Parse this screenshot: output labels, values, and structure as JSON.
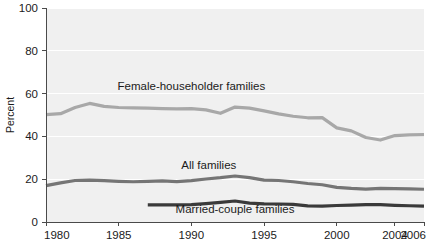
{
  "chart_data": {
    "type": "line",
    "title": "",
    "xlabel": "",
    "ylabel": "Percent",
    "ylim": [
      0,
      100
    ],
    "xlim": [
      1980,
      2006
    ],
    "grid": true,
    "legend_position": "inline-labels",
    "yticks": [
      0,
      20,
      40,
      60,
      80,
      100
    ],
    "ytick_labels": [
      "0",
      "20",
      "40",
      "60",
      "80",
      "100"
    ],
    "xticks": [
      1980,
      1985,
      1990,
      1995,
      2000,
      2004,
      2006
    ],
    "xtick_labels": [
      "1980",
      "1985",
      "1990",
      "1995",
      "2000",
      "2004",
      "2006"
    ],
    "x": [
      1980,
      1981,
      1982,
      1983,
      1984,
      1985,
      1986,
      1987,
      1988,
      1989,
      1990,
      1991,
      1992,
      1993,
      1994,
      1995,
      1996,
      1997,
      1998,
      1999,
      2000,
      2001,
      2002,
      2003,
      2004,
      2005,
      2006
    ],
    "series": [
      {
        "name": "Female-householder families",
        "color": "#a8a8a8",
        "line_width": 3.2,
        "label": "Female-householder families",
        "label_x": 1990.0,
        "label_y": 61.5,
        "values": [
          50.2,
          50.6,
          53.5,
          55.4,
          54.0,
          53.5,
          53.3,
          53.2,
          53.0,
          52.9,
          53.0,
          52.4,
          50.8,
          53.7,
          53.2,
          51.9,
          50.5,
          49.4,
          48.7,
          48.8,
          44.0,
          42.6,
          39.5,
          38.3,
          40.4,
          40.7,
          40.8
        ]
      },
      {
        "name": "All families",
        "color": "#757575",
        "line_width": 3.2,
        "label": "All families",
        "label_x": 1991.2,
        "label_y": 25.0,
        "values": [
          17.0,
          18.3,
          19.4,
          19.6,
          19.3,
          19.0,
          18.8,
          19.0,
          19.2,
          18.9,
          19.3,
          20.1,
          20.7,
          21.5,
          20.7,
          19.6,
          19.4,
          18.8,
          18.0,
          17.4,
          16.2,
          15.7,
          15.4,
          15.7,
          15.6,
          15.5,
          15.3
        ]
      },
      {
        "name": "Married-couple families",
        "color": "#3a3a3a",
        "line_width": 3.2,
        "label": "Married-couple families",
        "label_x": 1993.0,
        "label_y": 4.4,
        "start_year": 1987,
        "values": [
          null,
          null,
          null,
          null,
          null,
          null,
          null,
          8.0,
          8.0,
          8.0,
          8.1,
          8.6,
          9.2,
          9.8,
          8.8,
          8.5,
          8.4,
          8.2,
          7.5,
          7.4,
          7.7,
          7.9,
          8.1,
          8.1,
          7.8,
          7.6,
          7.4
        ]
      }
    ]
  },
  "layout": {
    "plot_left": 46,
    "plot_right": 424,
    "plot_top": 8,
    "plot_bottom": 222,
    "plot_bg": "#f0f0f0",
    "grid_color": "#ffffff",
    "axis_color": "#4a4a4a",
    "page_bg": "#ffffff"
  }
}
